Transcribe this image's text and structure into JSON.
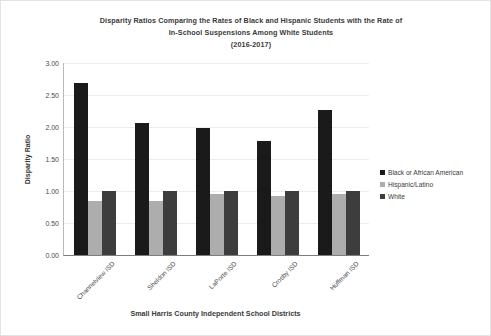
{
  "chart_data": {
    "type": "bar",
    "title": "Disparity Ratios Comparing the Rates of Black and Hispanic Students with the Rate of In-School Suspensions Among White Students (2016-2017)",
    "title_lines": [
      "Disparity Ratios Comparing the Rates of Black and Hispanic Students with the Rate of",
      "In-School Suspensions Among White Students",
      "(2016-2017)"
    ],
    "xlabel": "Small Harris County Independent School Districts",
    "ylabel": "Disparity Ratio",
    "categories": [
      "Channelview ISD",
      "Sheldon ISD",
      "LaPorte ISD",
      "Crosby ISD",
      "Huffman ISD"
    ],
    "series": [
      {
        "name": "Black or African American",
        "color": "#1a1a1a",
        "values": [
          2.68,
          2.07,
          1.98,
          1.78,
          2.27
        ]
      },
      {
        "name": "Hispanic/Latino",
        "color": "#adadad",
        "values": [
          0.84,
          0.85,
          0.95,
          0.92,
          0.95
        ]
      },
      {
        "name": "White",
        "color": "#3d3d3d",
        "values": [
          1.0,
          1.0,
          1.0,
          1.0,
          1.0
        ]
      }
    ],
    "ylim": [
      0.0,
      3.0
    ],
    "ytick_values": [
      0.0,
      0.5,
      1.0,
      1.5,
      2.0,
      2.5,
      3.0
    ],
    "ytick_labels": [
      "0.00",
      "0.50",
      "1.00",
      "1.50",
      "2.00",
      "2.50",
      "3.00"
    ],
    "grid": true,
    "legend_position": "right"
  }
}
